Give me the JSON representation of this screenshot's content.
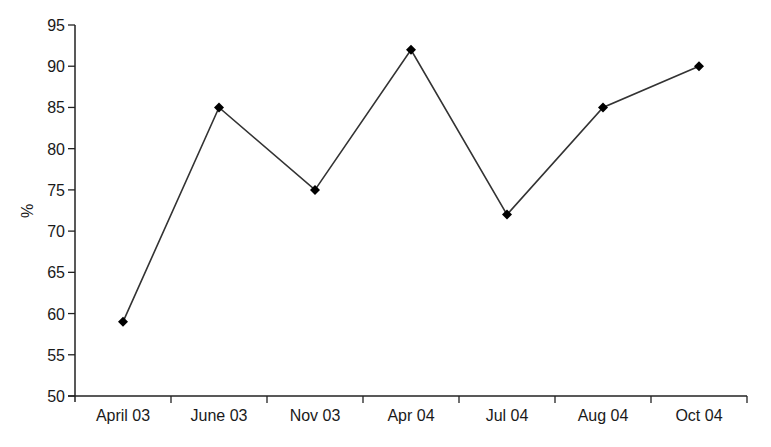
{
  "chart_data": {
    "type": "line",
    "title": "",
    "xlabel": "",
    "ylabel": "%",
    "categories": [
      "April 03",
      "June 03",
      "Nov 03",
      "Apr 04",
      "Jul 04",
      "Aug 04",
      "Oct 04"
    ],
    "series": [
      {
        "name": "%",
        "values": [
          59,
          85,
          75,
          92,
          72,
          85,
          90
        ],
        "marker": "diamond",
        "color": "#000000"
      }
    ],
    "ylim": [
      50,
      95
    ],
    "yticks": [
      50,
      55,
      60,
      65,
      70,
      75,
      80,
      85,
      90,
      95
    ],
    "grid": false,
    "legend": null
  }
}
